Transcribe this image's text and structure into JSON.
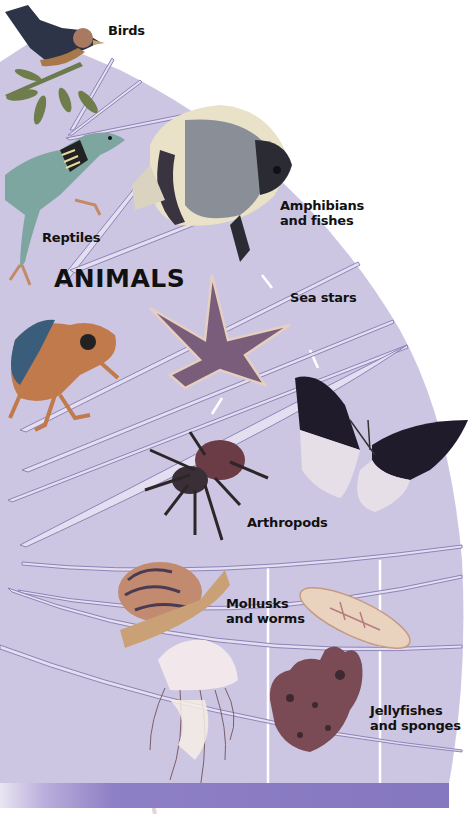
{
  "diagram": {
    "title": "ANIMALS",
    "groups": [
      {
        "id": "birds",
        "label_lines": [
          "Birds"
        ],
        "icon": "bird-icon"
      },
      {
        "id": "reptiles",
        "label_lines": [
          "Reptiles"
        ],
        "icon": "lizard-icon"
      },
      {
        "id": "amphibians-fishes",
        "label_lines": [
          "Amphibians",
          "and fishes"
        ],
        "icon": "fish-icon",
        "icon2": "frog-icon"
      },
      {
        "id": "sea-stars",
        "label_lines": [
          "Sea stars"
        ],
        "icon": "starfish-icon"
      },
      {
        "id": "arthropods",
        "label_lines": [
          "Arthropods"
        ],
        "icon": "spider-icon",
        "icon2": "butterfly-icon"
      },
      {
        "id": "mollusks-worms",
        "label_lines": [
          "Mollusks",
          "and worms"
        ],
        "icon": "snail-icon",
        "icon2": "flatworm-icon"
      },
      {
        "id": "jellyfishes-sponges",
        "label_lines": [
          "Jellyfishes",
          "and sponges"
        ],
        "icon": "jellyfish-icon",
        "icon2": "sponge-icon"
      }
    ],
    "colors": {
      "fan_fill": "#cdc6e3",
      "band_line": "#8d84b8",
      "band_highlight": "#e3def0",
      "bottom_bar": "#8576c0"
    }
  }
}
